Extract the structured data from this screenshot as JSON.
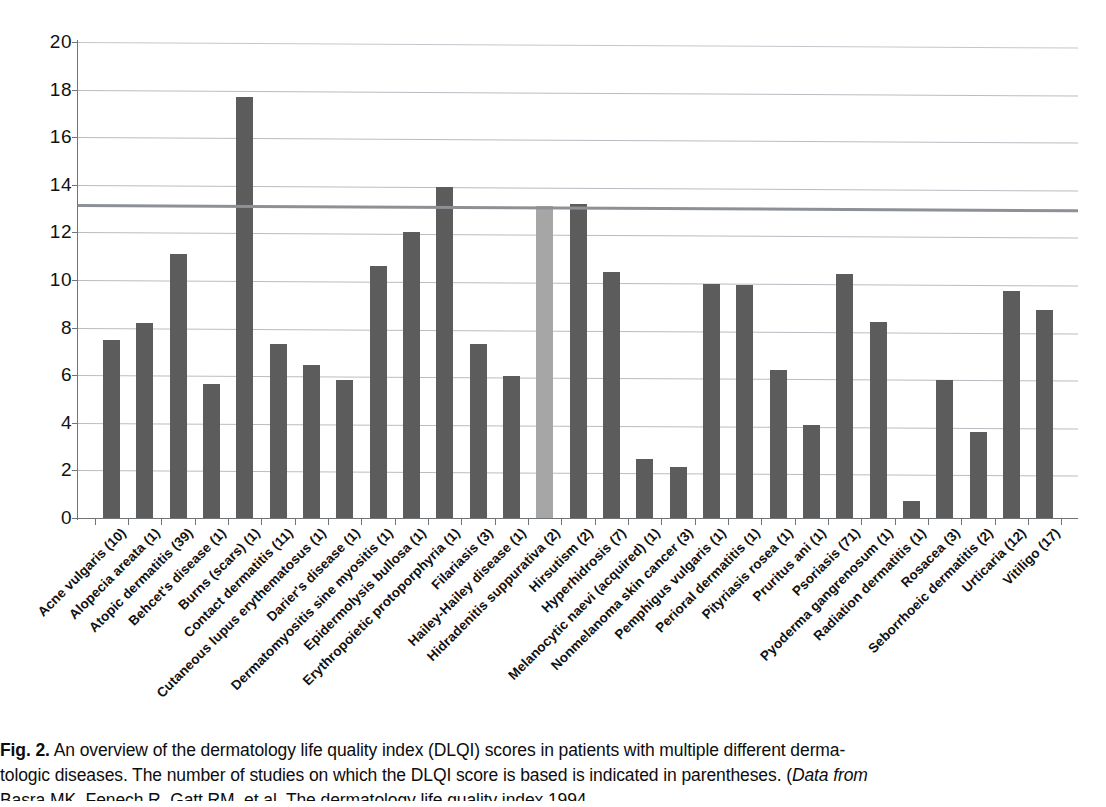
{
  "chart_data": {
    "type": "bar",
    "title": "",
    "xlabel": "",
    "ylabel": "",
    "ylim": [
      0,
      20
    ],
    "ytick_values": [
      0,
      2,
      4,
      6,
      8,
      10,
      12,
      14,
      16,
      18,
      20
    ],
    "ytick_labels": [
      "0",
      "2",
      "4",
      "6",
      "8",
      "10",
      "12",
      "14",
      "16",
      "18",
      "20"
    ],
    "grid": true,
    "legend": "none",
    "reference_line": {
      "value": 13.2,
      "label": "",
      "color": "#8d9196"
    },
    "highlight_color": "#a6a6a6",
    "bar_color": "#5c5c5c",
    "categories": [
      "Acne vulgaris (10)",
      "Alopecia areata (1)",
      "Atopic dermatitis (39)",
      "Behcet's disease (1)",
      "Burns (scars) (1)",
      "Contact dermatitis (11)",
      "Cutaneous lupus erythematosus (1)",
      "Darier's disease (1)",
      "Dermatomyositis sine myositis (1)",
      "Epidermolysis bullosa (1)",
      "Erythropoietic protoporphyria (1)",
      "Filariasis (3)",
      "Hailey-Hailey disease (1)",
      "Hidradenitis suppurativa (2)",
      "Hirsutism (2)",
      "Hyperhidrosis (7)",
      "Melanocytic naevi (acquired) (1)",
      "Nonmelanoma skin cancer (3)",
      "Pemphigus vulgaris (1)",
      "Perioral dermatitis (1)",
      "Pityriasis rosea (1)",
      "Pruritus ani (1)",
      "Psoriasis (71)",
      "Pyoderma gangrenosum (1)",
      "Radiation dermatitis (1)",
      "Rosacea (3)",
      "Seborrhoeic dermatitis (2)",
      "Urticaria (12)",
      "Vitiligo (17)"
    ],
    "values": [
      7.5,
      8.2,
      11.1,
      5.65,
      17.7,
      7.3,
      6.45,
      5.8,
      10.6,
      12.0,
      13.9,
      7.3,
      5.95,
      13.1,
      13.2,
      10.35,
      2.5,
      2.15,
      9.85,
      9.8,
      6.2,
      3.9,
      10.25,
      8.25,
      0.7,
      5.8,
      3.6,
      9.55,
      8.75
    ],
    "highlighted_index": 13
  },
  "caption": {
    "figure_label": "Fig. 2.",
    "line1": "An overview of the dermatology life quality index (DLQI) scores in patients with multiple different derma-",
    "line2_plain": "tologic diseases. The number of studies on which the DLQI score is based is indicated in parentheses. (",
    "line2_italic": "Data from",
    "line3": "Basra MK, Fenech R, Gatt RM, et al. The dermatology life quality index 1994"
  }
}
